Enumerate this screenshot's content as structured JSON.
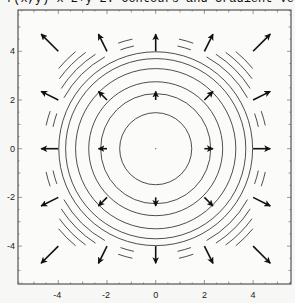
{
  "chart_data": {
    "type": "contour+vector",
    "title": "f(x,y)=x^2+y^2: Contours and Gradient Vector",
    "function": "f(x,y)=x^2+y^2",
    "xlabel": "",
    "ylabel": "",
    "xlim": [
      -5.6,
      5.6
    ],
    "ylim": [
      -5.6,
      5.6
    ],
    "x_ticks": [
      -4,
      -2,
      0,
      2,
      4
    ],
    "y_ticks": [
      -4,
      -2,
      0,
      2,
      4
    ],
    "x_tick_labels": [
      "-4",
      "-2",
      "0",
      "2",
      "4"
    ],
    "y_tick_labels": [
      "4",
      "2",
      "0",
      "-2",
      "-4"
    ],
    "grid": false,
    "legend": null,
    "contour_radii": [
      1.48,
      2.26,
      2.75,
      3.29,
      3.7,
      3.98,
      4.31,
      4.6,
      4.89,
      5.17
    ],
    "vector_field": {
      "description": "gradient field (2x, 2y), scaled",
      "grid_x": [
        -4,
        -2,
        0,
        2,
        4
      ],
      "grid_y": [
        -4,
        -2,
        0,
        2,
        4
      ],
      "scale_px_per_unit_gradient": 4.3,
      "omitted_points": [
        [
          0,
          0
        ]
      ]
    }
  }
}
